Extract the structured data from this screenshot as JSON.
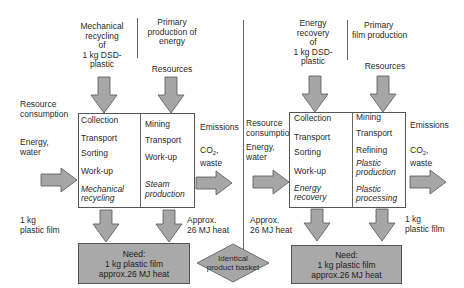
{
  "left_scenario": {
    "heading_recycling": [
      "Mechanical",
      "recycling",
      "of",
      "1 kg DSD-",
      "plastic"
    ],
    "heading_primary": [
      "Primary",
      "production of",
      "energy"
    ],
    "resources_label": "Resources",
    "resource_consumption_label": [
      "Resource",
      "consumption"
    ],
    "input_label": [
      "Energy,",
      "water"
    ],
    "emissions_label": "Emissions",
    "emissions_detail": {
      "co": "CO",
      "sub": "2",
      "suffix": ",",
      "waste": "waste"
    },
    "process_left_steps": [
      {
        "label": "Collection",
        "italic": false
      },
      {
        "label": "Transport",
        "italic": false
      },
      {
        "label": "Sorting",
        "italic": false
      },
      {
        "label": "Work-up",
        "italic": false
      },
      {
        "label": "Mechanical",
        "italic": true
      },
      {
        "label": "recycling",
        "italic": true
      }
    ],
    "process_right_steps": [
      {
        "label": "Mining",
        "italic": false
      },
      {
        "label": "Transport",
        "italic": false
      },
      {
        "label": "Work-up",
        "italic": false
      },
      {
        "label": "Steam",
        "italic": true
      },
      {
        "label": "production",
        "italic": true
      }
    ],
    "output_left_label": [
      "1 kg",
      "plastic film"
    ],
    "output_right_label": [
      "Approx.",
      "26 MJ heat"
    ],
    "need_box": [
      "Need:",
      "1 kg plastic film",
      "approx.26 MJ heat"
    ]
  },
  "right_scenario": {
    "heading_recovery": [
      "Energy",
      "recovery",
      "of",
      "1 kg DSD-",
      "plastic"
    ],
    "heading_primary": [
      "Primary",
      "film production"
    ],
    "resources_label": "Resources",
    "resource_consumption_label": [
      "Resource",
      "consumption"
    ],
    "input_label": [
      "Energy,",
      "water"
    ],
    "emissions_label": "Emissions",
    "emissions_detail": {
      "co": "CO",
      "sub": "2",
      "suffix": ",",
      "waste": "waste"
    },
    "process_left_steps": [
      {
        "label": "Collection",
        "italic": false
      },
      {
        "label": "Transport",
        "italic": false
      },
      {
        "label": "Sorting",
        "italic": false
      },
      {
        "label": "Work-up",
        "italic": false
      },
      {
        "label": "Energy",
        "italic": true
      },
      {
        "label": "recovery",
        "italic": true
      }
    ],
    "process_right_steps": [
      {
        "label": "Mining",
        "italic": false
      },
      {
        "label": "Transport",
        "italic": false
      },
      {
        "label": "Refining",
        "italic": false
      },
      {
        "label": "Plastic",
        "italic": true
      },
      {
        "label": "production",
        "italic": true
      },
      {
        "label": "Plastic",
        "italic": true
      },
      {
        "label": "processing",
        "italic": true
      }
    ],
    "output_left_label": [
      "Approx.",
      "26 MJ heat"
    ],
    "output_right_label": [
      "1 kg",
      "plastic film"
    ],
    "need_box": [
      "Need:",
      "1 kg plastic film",
      "approx.26 MJ heat"
    ]
  },
  "center": {
    "diamond_label": [
      "Identical",
      "product basket"
    ]
  },
  "colors": {
    "arrow_fill": "#a6a6a6",
    "arrow_stroke": "#555555",
    "need_fill": "#a9a9a9",
    "diamond_fill": "#a6a6a6",
    "line": "#666666"
  }
}
